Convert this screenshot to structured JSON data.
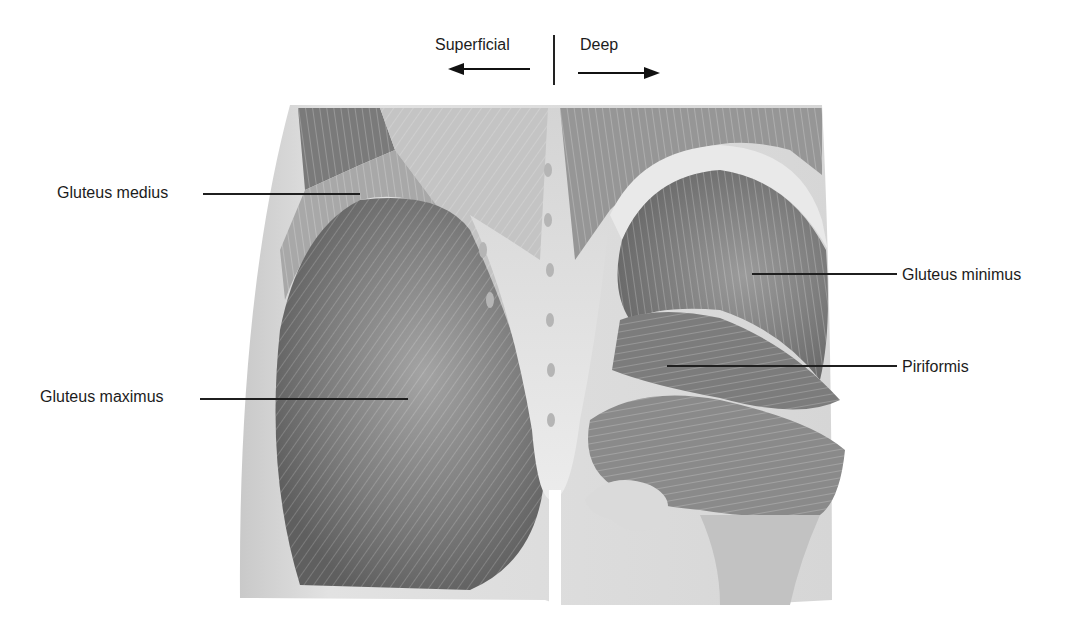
{
  "figure": {
    "orientation": {
      "left_label": "Superficial",
      "right_label": "Deep",
      "left_arrow": "arrow-left",
      "right_arrow": "arrow-right"
    },
    "labels": [
      {
        "id": "gluteus-medius",
        "text": "Gluteus medius",
        "side": "left"
      },
      {
        "id": "gluteus-maximus",
        "text": "Gluteus maximus",
        "side": "left"
      },
      {
        "id": "gluteus-minimus",
        "text": "Gluteus minimus",
        "side": "right"
      },
      {
        "id": "piriformis",
        "text": "Piriformis",
        "side": "right"
      }
    ],
    "colors": {
      "background": "#ffffff",
      "skin": "#d9d9d9",
      "muscle_dark": "#6e6e6e",
      "muscle_mid": "#8f8f8f",
      "fascia_light": "#e6e6e6",
      "text": "#1c1c1c"
    }
  }
}
